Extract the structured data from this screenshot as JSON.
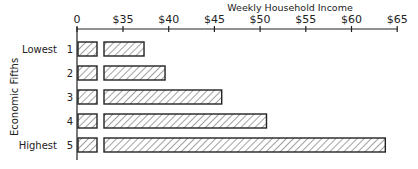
{
  "chart_data": {
    "type": "bar",
    "orientation": "horizontal",
    "title": "Weekly Household Income",
    "xlabel": "Weekly Household Income",
    "ylabel": "Economic Fifths",
    "x_ticks": [
      "0",
      "$35",
      "$40",
      "$45",
      "$50",
      "$55",
      "$60",
      "$65"
    ],
    "x_axis_break": "broken axis between 0 and $35",
    "xlim": [
      30,
      65
    ],
    "categories": [
      "1",
      "2",
      "3",
      "4",
      "5"
    ],
    "category_labels": [
      "Lowest",
      "",
      "",
      "",
      "Highest"
    ],
    "values": [
      37.3,
      39.6,
      45.8,
      50.7,
      63.7
    ],
    "grid": false,
    "legend": null,
    "bar_fill": "diagonal hatch",
    "colors": {
      "ink": "#222222",
      "background": "#ffffff"
    }
  },
  "labels": {
    "title": "Weekly Household Income",
    "ylabel": "Economic Fifths",
    "ticks": [
      "0",
      "$35",
      "$40",
      "$45",
      "$50",
      "$55",
      "$60",
      "$65"
    ],
    "rows": [
      {
        "group": "Lowest",
        "num": "1"
      },
      {
        "group": "",
        "num": "2"
      },
      {
        "group": "",
        "num": "3"
      },
      {
        "group": "",
        "num": "4"
      },
      {
        "group": "Highest",
        "num": "5"
      }
    ]
  }
}
